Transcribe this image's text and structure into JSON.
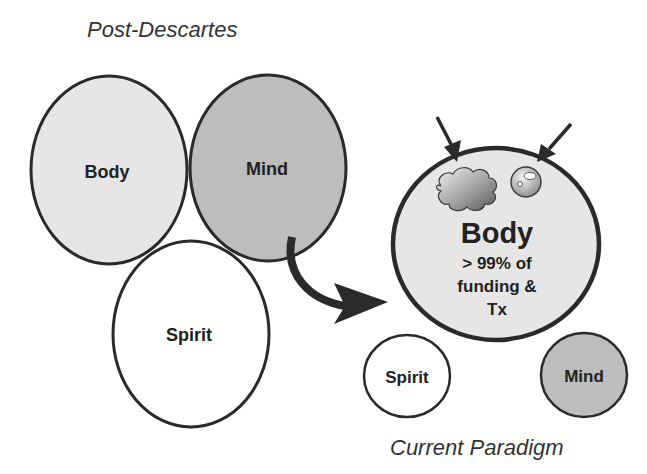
{
  "left_group": {
    "title": "Post-Descartes",
    "circles": [
      {
        "label": "Body",
        "fill": "#e6e6e6"
      },
      {
        "label": "Mind",
        "fill": "#bdbdbd"
      },
      {
        "label": "Spirit",
        "fill": "#ffffff"
      }
    ]
  },
  "right_group": {
    "title": "Current Paradigm",
    "main_circle": {
      "label": "Body",
      "sub_lines": [
        "> 99% of",
        "funding &",
        "Tx"
      ],
      "fill": "#e6e6e6",
      "icons": [
        "cloud-icon",
        "bubble-icon"
      ]
    },
    "small_circles": [
      {
        "label": "Spirit",
        "fill": "#ffffff"
      },
      {
        "label": "Mind",
        "fill": "#bdbdbd"
      }
    ]
  },
  "colors": {
    "stroke": "#2a2a2a",
    "text": "#222222"
  }
}
